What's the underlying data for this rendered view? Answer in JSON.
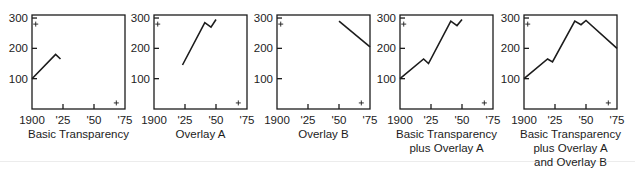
{
  "panels": [
    {
      "caption_lines": [
        "Basic Transparency"
      ]
    },
    {
      "caption_lines": [
        "Overlay A"
      ]
    },
    {
      "caption_lines": [
        "Overlay B"
      ]
    },
    {
      "caption_lines": [
        "Basic Transparency",
        "plus Overlay A"
      ]
    },
    {
      "caption_lines": [
        "Basic Transparency",
        "plus Overlay A",
        "and Overlay B"
      ]
    }
  ],
  "axes": {
    "y_ticks": [
      "300",
      "200",
      "100"
    ],
    "x_ticks": [
      "1900",
      "'25",
      "'50",
      "'75"
    ]
  },
  "colors": {
    "line": "#1c1c1c",
    "frame": "#1c1c1c",
    "divider": "#ececec"
  },
  "chart_data": [
    {
      "type": "line",
      "title": "Basic Transparency",
      "xlabel": "",
      "ylabel": "",
      "xlim": [
        1900,
        1975
      ],
      "ylim": [
        0,
        310
      ],
      "x_ticks": [
        1900,
        1925,
        1950,
        1975
      ],
      "x_tick_labels": [
        "1900",
        "'25",
        "'50",
        "'75"
      ],
      "y_ticks": [
        100,
        200,
        300
      ],
      "grid": false,
      "series": [
        {
          "name": "Basic",
          "x": [
            1900,
            1919,
            1923
          ],
          "y": [
            100,
            180,
            165
          ]
        }
      ],
      "markers": [
        {
          "x": 1903,
          "y": 280,
          "symbol": "+"
        },
        {
          "x": 1968,
          "y": 20,
          "symbol": "+"
        }
      ]
    },
    {
      "type": "line",
      "title": "Overlay A",
      "xlabel": "",
      "ylabel": "",
      "xlim": [
        1900,
        1975
      ],
      "ylim": [
        0,
        310
      ],
      "x_ticks": [
        1900,
        1925,
        1950,
        1975
      ],
      "x_tick_labels": [
        "1900",
        "'25",
        "'50",
        "'75"
      ],
      "y_ticks": [
        100,
        200,
        300
      ],
      "grid": false,
      "series": [
        {
          "name": "Overlay A",
          "x": [
            1923,
            1941,
            1946,
            1950
          ],
          "y": [
            145,
            285,
            270,
            295
          ]
        }
      ],
      "markers": [
        {
          "x": 1903,
          "y": 280,
          "symbol": "+"
        },
        {
          "x": 1968,
          "y": 20,
          "symbol": "+"
        }
      ]
    },
    {
      "type": "line",
      "title": "Overlay B",
      "xlabel": "",
      "ylabel": "",
      "xlim": [
        1900,
        1975
      ],
      "ylim": [
        0,
        310
      ],
      "x_ticks": [
        1900,
        1925,
        1950,
        1975
      ],
      "x_tick_labels": [
        "1900",
        "'25",
        "'50",
        "'75"
      ],
      "y_ticks": [
        100,
        200,
        300
      ],
      "grid": false,
      "series": [
        {
          "name": "Overlay B",
          "x": [
            1950,
            1975
          ],
          "y": [
            290,
            205
          ]
        }
      ],
      "markers": [
        {
          "x": 1903,
          "y": 280,
          "symbol": "+"
        },
        {
          "x": 1968,
          "y": 20,
          "symbol": "+"
        }
      ]
    },
    {
      "type": "line",
      "title": "Basic Transparency plus Overlay A",
      "xlabel": "",
      "ylabel": "",
      "xlim": [
        1900,
        1975
      ],
      "ylim": [
        0,
        310
      ],
      "x_ticks": [
        1900,
        1925,
        1950,
        1975
      ],
      "x_tick_labels": [
        "1900",
        "'25",
        "'50",
        "'75"
      ],
      "y_ticks": [
        100,
        200,
        300
      ],
      "grid": false,
      "series": [
        {
          "name": "Basic + A",
          "x": [
            1900,
            1919,
            1923,
            1941,
            1946,
            1950
          ],
          "y": [
            100,
            165,
            150,
            290,
            275,
            295
          ]
        }
      ],
      "markers": [
        {
          "x": 1903,
          "y": 280,
          "symbol": "+"
        },
        {
          "x": 1968,
          "y": 20,
          "symbol": "+"
        }
      ]
    },
    {
      "type": "line",
      "title": "Basic Transparency plus Overlay A and Overlay B",
      "xlabel": "",
      "ylabel": "",
      "xlim": [
        1900,
        1975
      ],
      "ylim": [
        0,
        310
      ],
      "x_ticks": [
        1900,
        1925,
        1950,
        1975
      ],
      "x_tick_labels": [
        "1900",
        "'25",
        "'50",
        "'75"
      ],
      "y_ticks": [
        100,
        200,
        300
      ],
      "grid": false,
      "series": [
        {
          "name": "Basic + A + B",
          "x": [
            1900,
            1919,
            1923,
            1941,
            1946,
            1950,
            1975
          ],
          "y": [
            100,
            165,
            155,
            290,
            278,
            292,
            200
          ]
        }
      ],
      "markers": [
        {
          "x": 1903,
          "y": 280,
          "symbol": "+"
        },
        {
          "x": 1968,
          "y": 20,
          "symbol": "+"
        }
      ]
    }
  ]
}
